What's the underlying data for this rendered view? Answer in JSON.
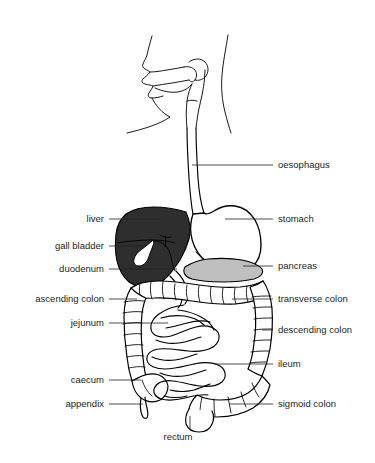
{
  "figure": {
    "background_color": "#ffffff",
    "line_color": "#000000",
    "text_color": "#231f20"
  },
  "colors": {
    "liver_fill": "#2e2e2e",
    "pancreas_fill": "#bfbfbf",
    "stomach_fill": "#ffffff",
    "gallbladder_fill": "#ffffff",
    "outline": "#000000",
    "label": "#231f20"
  },
  "labels": [
    {
      "id": "oesophagus",
      "text": "oesophagus",
      "side": "right",
      "x": 278,
      "y": 165
    },
    {
      "id": "stomach",
      "text": "stomach",
      "side": "right",
      "x": 278,
      "y": 219
    },
    {
      "id": "pancreas",
      "text": "pancreas",
      "side": "right",
      "x": 278,
      "y": 266
    },
    {
      "id": "transverse-colon",
      "text": "transverse colon",
      "side": "right",
      "x": 278,
      "y": 299
    },
    {
      "id": "descending-colon",
      "text": "descending colon",
      "side": "right",
      "x": 278,
      "y": 330
    },
    {
      "id": "ileum",
      "text": "ileum",
      "side": "right",
      "x": 278,
      "y": 364
    },
    {
      "id": "sigmoid-colon",
      "text": "sigmoid colon",
      "side": "right",
      "x": 278,
      "y": 404
    },
    {
      "id": "liver",
      "text": "liver",
      "side": "left",
      "x": 104,
      "y": 219
    },
    {
      "id": "gall-bladder",
      "text": "gall bladder",
      "side": "left",
      "x": 104,
      "y": 246
    },
    {
      "id": "duodenum",
      "text": "duodenum",
      "side": "left",
      "x": 104,
      "y": 269
    },
    {
      "id": "ascending-colon",
      "text": "ascending colon",
      "side": "left",
      "x": 104,
      "y": 299
    },
    {
      "id": "jejunum",
      "text": "jejunum",
      "side": "left",
      "x": 104,
      "y": 323
    },
    {
      "id": "caecum",
      "text": "caecum",
      "side": "left",
      "x": 104,
      "y": 380
    },
    {
      "id": "appendix",
      "text": "appendix",
      "side": "left",
      "x": 104,
      "y": 404
    },
    {
      "id": "rectum",
      "text": "rectum",
      "side": "below",
      "x": 178,
      "y": 437
    }
  ],
  "organs": [
    {
      "id": "head-profile",
      "name": "head and mouth profile"
    },
    {
      "id": "oesophagus-tube",
      "name": "oesophagus"
    },
    {
      "id": "stomach-body",
      "name": "stomach"
    },
    {
      "id": "liver-body",
      "name": "liver"
    },
    {
      "id": "gallbladder-body",
      "name": "gall bladder"
    },
    {
      "id": "pancreas-body",
      "name": "pancreas"
    },
    {
      "id": "duodenum-body",
      "name": "duodenum"
    },
    {
      "id": "large-intestine",
      "name": "large intestine"
    },
    {
      "id": "small-intestine",
      "name": "small intestine"
    },
    {
      "id": "caecum-body",
      "name": "caecum"
    },
    {
      "id": "appendix-body",
      "name": "appendix"
    },
    {
      "id": "rectum-body",
      "name": "rectum"
    }
  ]
}
